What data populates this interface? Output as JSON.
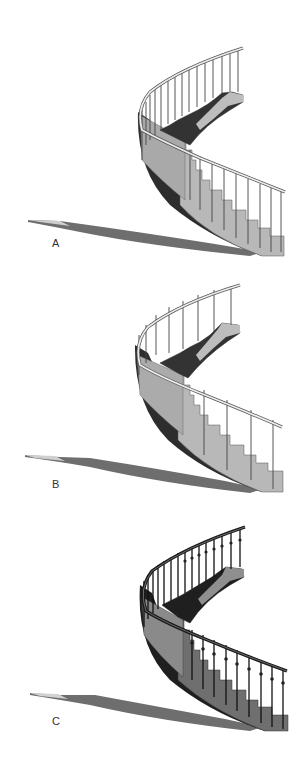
{
  "figure": {
    "colors": {
      "background": "#ffffff",
      "stringer_dark": "#2a2a2a",
      "tread_light": "#b9b9b9",
      "tread_dark": "#3a3a3a",
      "riser_mid": "#8c8c8c",
      "shadow": "#6e6e6e",
      "rail": "#e6e6e6",
      "rail_outline": "#555555"
    },
    "panels": [
      {
        "id": "A",
        "label": "A",
        "baluster_style": "thin plain balusters, one per tread",
        "baluster_count": 22
      },
      {
        "id": "B",
        "label": "B",
        "baluster_style": "sparse plain posts, widely spaced",
        "baluster_count": 12
      },
      {
        "id": "C",
        "label": "C",
        "baluster_style": "dark turned balusters with knuckle collars",
        "baluster_count": 26
      }
    ]
  }
}
